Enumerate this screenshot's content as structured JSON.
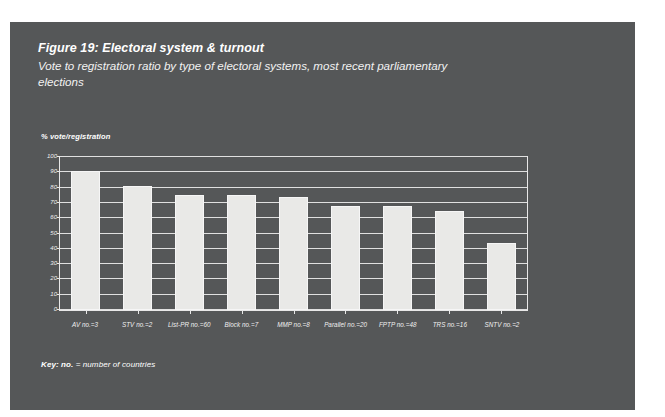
{
  "figure": {
    "title": "Figure 19: Electoral system & turnout",
    "subtitle": "Vote to registration ratio by type of electoral systems, most recent parliamentary elections",
    "key_label": "Key: no.",
    "key_text": " = number of countries"
  },
  "colors": {
    "panel_background": "#555758",
    "bar_fill": "#e9e9e7",
    "gridline": "#e0e0e0",
    "text": "#ffffff"
  },
  "chart_data": {
    "type": "bar",
    "title": "Figure 19: Electoral system & turnout",
    "subtitle": "Vote to registration ratio by type of electoral systems, most recent parliamentary elections",
    "xlabel": "",
    "ylabel": "% vote/registration",
    "ylim": [
      0,
      100
    ],
    "yticks": [
      0,
      10,
      20,
      30,
      40,
      50,
      60,
      70,
      80,
      90,
      100
    ],
    "grid": true,
    "legend": "none",
    "categories": [
      "AV no.=3",
      "STV no.=2",
      "List-PR no.=60",
      "Block no.=7",
      "MMP no.=8",
      "Parallel no.=20",
      "FPTP no.=48",
      "TRS no.=16",
      "SNTV no.=2"
    ],
    "values": [
      91,
      81,
      75,
      75,
      74,
      68,
      68,
      65,
      44
    ],
    "system_counts": [
      3,
      2,
      60,
      7,
      8,
      20,
      48,
      16,
      2
    ]
  }
}
